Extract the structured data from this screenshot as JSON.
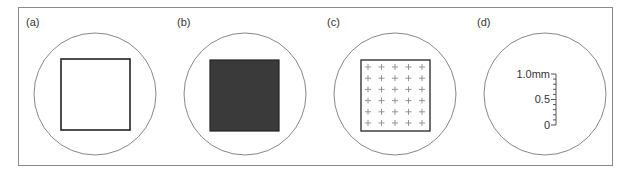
{
  "figure": {
    "frame_color": "#8a8a8a",
    "panels": [
      {
        "id": "a",
        "label": "(a)",
        "content": "open-square",
        "description": "empty field of view with outlined square"
      },
      {
        "id": "b",
        "label": "(b)",
        "content": "filled-square",
        "description": "field of view with dark filled square",
        "fill_color": "#3a3a3a"
      },
      {
        "id": "c",
        "label": "(c)",
        "content": "grid-square",
        "description": "square with grid of plus marks",
        "grid": {
          "columns": 5,
          "rows": 6,
          "mark": "+"
        }
      },
      {
        "id": "d",
        "label": "(d)",
        "content": "scale-ruler",
        "description": "vertical scale ruler",
        "ruler": {
          "labels": [
            "1.0mm",
            "0.5",
            "0"
          ],
          "divisions": 10
        }
      }
    ]
  }
}
